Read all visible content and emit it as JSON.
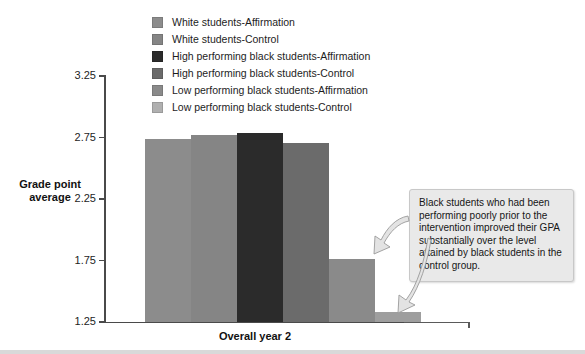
{
  "chart_data": {
    "type": "bar",
    "title": "",
    "xlabel": "Overall year 2",
    "ylabel": "Grade point average",
    "ylim": [
      1.25,
      3.25
    ],
    "ytick_labels": [
      "3.25",
      "2.75",
      "2.25",
      "1.75",
      "1.25"
    ],
    "yticks": [
      3.25,
      2.75,
      2.25,
      1.75,
      1.25
    ],
    "grid": false,
    "legend_position": "top-center",
    "categories": [
      "Overall year 2"
    ],
    "series": [
      {
        "name": "White students-Affirmation",
        "values": [
          2.73
        ],
        "color": "#8c8c8c"
      },
      {
        "name": "White students-Control",
        "values": [
          2.76
        ],
        "color": "#858585"
      },
      {
        "name": "High performing black students-Affirmation",
        "values": [
          2.78
        ],
        "color": "#2b2b2b"
      },
      {
        "name": "High performing black students-Control",
        "values": [
          2.7
        ],
        "color": "#6b6b6b"
      },
      {
        "name": "Low performing black students-Affirmation",
        "values": [
          1.76
        ],
        "color": "#8a8a8a"
      },
      {
        "name": "Low performing black students-Control",
        "values": [
          1.33
        ],
        "color": "#9e9e9e"
      }
    ],
    "annotations": [
      {
        "text": "Black students who had been performing poorly prior to the intervention improved their GPA substantially over the level attained by black students in the control group.",
        "points_to": [
          "Low performing black students-Affirmation",
          "Low performing black students-Control"
        ]
      }
    ]
  },
  "legend": {
    "items": [
      {
        "label": "White students-Affirmation",
        "color": "#8c8c8c"
      },
      {
        "label": "White students-Control",
        "color": "#858585"
      },
      {
        "label": "High performing black students-Affirmation",
        "color": "#2b2b2b"
      },
      {
        "label": "High performing black students-Control",
        "color": "#6b6b6b"
      },
      {
        "label": "Low performing black students-Affirmation",
        "color": "#8a8a8a"
      },
      {
        "label": "Low performing black students-Control",
        "color": "#b0b0b0"
      }
    ]
  },
  "axes": {
    "y_title": "Grade point average",
    "x_title": "Overall year 2",
    "y_labels": [
      "3.25",
      "2.75",
      "2.25",
      "1.75",
      "1.25"
    ]
  },
  "annotation": {
    "text": "Black students who had been performing poorly prior to the intervention improved their GPA substantially over the level attained by black students in the control group."
  },
  "colors": {
    "axis": "#4a4a4a",
    "annotation_bg": "#e9e9e9",
    "annotation_border": "#c8c8c8",
    "text": "#1a1a1a"
  }
}
